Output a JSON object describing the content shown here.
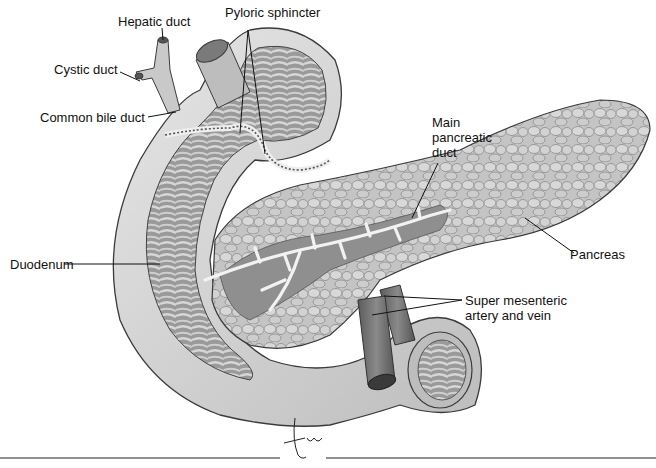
{
  "diagram": {
    "labels": {
      "hepatic_duct": "Hepatic duct",
      "pyloric_sphincter": "Pyloric sphincter",
      "cystic_duct": "Cystic duct",
      "common_bile_duct": "Common bile duct",
      "main_pancreatic_duct_line1": "Main",
      "main_pancreatic_duct_line2": "pancreatic",
      "main_pancreatic_duct_line3": "duct",
      "duodenum": "Duodenum",
      "pancreas": "Pancreas",
      "sma_line1": "Super mesenteric",
      "sma_line2": "artery and vein"
    },
    "signature": "Tina",
    "colors": {
      "background": "#ffffff",
      "tissue_light": "#d9d9d9",
      "tissue_mid": "#a8a8a8",
      "tissue_dark": "#6e6e6e",
      "outline": "#3a3a3a",
      "label_text": "#111111"
    }
  }
}
